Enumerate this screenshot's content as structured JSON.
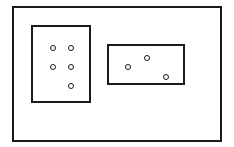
{
  "diagram": {
    "type": "set-diagram",
    "universe": {
      "x": 13,
      "y": 7,
      "width": 208,
      "height": 134
    },
    "sets": [
      {
        "name": "set-a",
        "x": 32,
        "y": 26,
        "width": 58,
        "height": 76,
        "elements": [
          {
            "cx": 53,
            "cy": 48
          },
          {
            "cx": 71,
            "cy": 48
          },
          {
            "cx": 53,
            "cy": 67
          },
          {
            "cx": 71,
            "cy": 67
          },
          {
            "cx": 71,
            "cy": 86
          }
        ]
      },
      {
        "name": "set-b",
        "x": 108,
        "y": 45,
        "width": 76,
        "height": 39,
        "elements": [
          {
            "cx": 128,
            "cy": 67
          },
          {
            "cx": 147,
            "cy": 58
          },
          {
            "cx": 166,
            "cy": 77
          }
        ]
      }
    ],
    "element_counts": {
      "set-a": 5,
      "set-b": 3
    },
    "stroke_color": "#1a1a1a",
    "background_color": "#ffffff"
  }
}
